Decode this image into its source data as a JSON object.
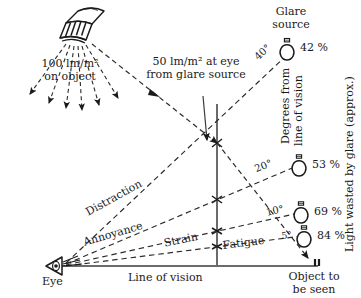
{
  "diagram": {
    "title_semantic": "glare-and-line-of-vision-lighting-diagram",
    "labels": {
      "luminaire_illuminance_line1": "100 lm/m²",
      "luminaire_illuminance_line2": "on object",
      "eye_illuminance_line1": "50 lm/m² at eye",
      "eye_illuminance_line2": "from glare source",
      "glare_source_line1": "Glare",
      "glare_source_line2": "source",
      "degrees_axis_line1": "Degrees from",
      "degrees_axis_line2": "line of vision",
      "light_wasted_axis": "Light wasted by glare (approx.)",
      "eye": "Eye",
      "line_of_vision": "Line of vision",
      "object_line1": "Object to",
      "object_line2": "be seen"
    },
    "effect_rays": [
      {
        "name": "distraction",
        "label": "Distraction",
        "angle_deg": -29.0
      },
      {
        "name": "annoyance",
        "label": "Annoyance",
        "angle_deg": -16.0
      },
      {
        "name": "strain",
        "label": "Strain",
        "angle_deg": -9.5
      },
      {
        "name": "fatigue",
        "label": "Fatigue",
        "angle_deg": -5.5
      }
    ],
    "glare_scale": [
      {
        "angle": "40°",
        "waste": "42 %"
      },
      {
        "angle": "20°",
        "waste": "53 %"
      },
      {
        "angle": "10°",
        "waste": "69 %"
      },
      {
        "angle": "5°",
        "waste": "84 %"
      }
    ],
    "colors": {
      "ink": "#1a1a1a",
      "dash": "#2b2b2b",
      "background": "#ffffff"
    }
  }
}
